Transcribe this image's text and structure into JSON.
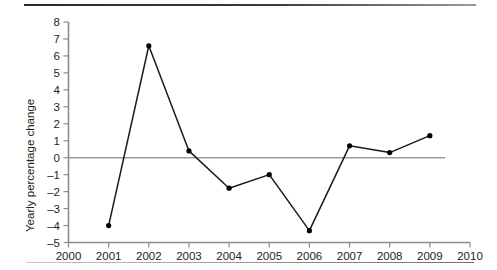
{
  "figure": {
    "background_color": "#ffffff",
    "rule_top_color": "#2b2b2b",
    "rule_bottom_color": "#8d8d8d"
  },
  "chart_data": {
    "type": "line",
    "title": "",
    "subtitle": "",
    "xlabel": "",
    "ylabel": "Yearly percentage change",
    "x": [
      2001,
      2002,
      2003,
      2004,
      2005,
      2006,
      2007,
      2008,
      2009
    ],
    "values": [
      -4.0,
      6.6,
      0.4,
      -1.8,
      -1.0,
      -4.3,
      0.7,
      0.3,
      1.3
    ],
    "series": [
      {
        "name": "Yearly percentage change",
        "values": [
          -4.0,
          6.6,
          0.4,
          -1.8,
          -1.0,
          -4.3,
          0.7,
          0.3,
          1.3
        ]
      }
    ],
    "xlim": [
      2000,
      2010
    ],
    "ylim": [
      -5,
      8
    ],
    "xticks": [
      2000,
      2001,
      2002,
      2003,
      2004,
      2005,
      2006,
      2007,
      2008,
      2009,
      2010
    ],
    "xtick_labels": [
      "2000",
      "2001",
      "2002",
      "2003",
      "2004",
      "2005",
      "2006",
      "2007",
      "2008",
      "2009",
      "2010"
    ],
    "yticks": [
      -5,
      -4,
      -3,
      -2,
      -1,
      0,
      1,
      2,
      3,
      4,
      5,
      6,
      7,
      8
    ],
    "ytick_labels": [
      "-5",
      "-4",
      "-3",
      "-2",
      "-1",
      "0",
      "1",
      "2",
      "3",
      "4",
      "5",
      "6",
      "7",
      "8"
    ],
    "grid": false,
    "legend": false,
    "legend_position": "none",
    "zero_line": 0,
    "line_color": "#1a1a1a",
    "marker_color": "#000000",
    "marker": "circle",
    "axis_color": "#8c8c8c",
    "zero_line_color": "#9a9a9a",
    "annotations": []
  }
}
